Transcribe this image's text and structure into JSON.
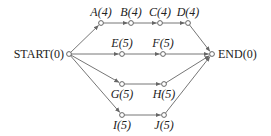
{
  "diagram": {
    "type": "activity-network",
    "nodes": [
      {
        "id": "START",
        "label": "START",
        "value": "(0)",
        "x": 69,
        "y": 54
      },
      {
        "id": "A",
        "label": "A",
        "value": "(4)",
        "x": 101,
        "y": 23
      },
      {
        "id": "B",
        "label": "B",
        "value": "(4)",
        "x": 131,
        "y": 23
      },
      {
        "id": "C",
        "label": "C",
        "value": "(4)",
        "x": 160,
        "y": 23
      },
      {
        "id": "D",
        "label": "D",
        "value": "(4)",
        "x": 188,
        "y": 23
      },
      {
        "id": "E",
        "label": "E",
        "value": "(5)",
        "x": 122,
        "y": 54
      },
      {
        "id": "F",
        "label": "F",
        "value": "(5)",
        "x": 163,
        "y": 54
      },
      {
        "id": "G",
        "label": "G",
        "value": "(5)",
        "x": 122,
        "y": 84
      },
      {
        "id": "H",
        "label": "H",
        "value": "(5)",
        "x": 164,
        "y": 84
      },
      {
        "id": "I",
        "label": "I",
        "value": "(5)",
        "x": 122,
        "y": 115
      },
      {
        "id": "J",
        "label": "J",
        "value": "(5)",
        "x": 164,
        "y": 115
      },
      {
        "id": "END",
        "label": "END",
        "value": "(0)",
        "x": 212,
        "y": 54
      }
    ],
    "edges": [
      [
        "START",
        "A"
      ],
      [
        "A",
        "B"
      ],
      [
        "B",
        "C"
      ],
      [
        "C",
        "D"
      ],
      [
        "D",
        "END"
      ],
      [
        "START",
        "E"
      ],
      [
        "E",
        "F"
      ],
      [
        "F",
        "END"
      ],
      [
        "START",
        "G"
      ],
      [
        "G",
        "H"
      ],
      [
        "H",
        "END"
      ],
      [
        "START",
        "I"
      ],
      [
        "I",
        "J"
      ],
      [
        "J",
        "END"
      ]
    ],
    "labels": {
      "start": "START(0)",
      "end": "END(0)",
      "A": "A(4)",
      "B": "B(4)",
      "C": "C(4)",
      "D": "D(4)",
      "E": "E(5)",
      "F": "F(5)",
      "G": "G(5)",
      "H": "H(5)",
      "I": "I(5)",
      "J": "J(5)"
    }
  }
}
